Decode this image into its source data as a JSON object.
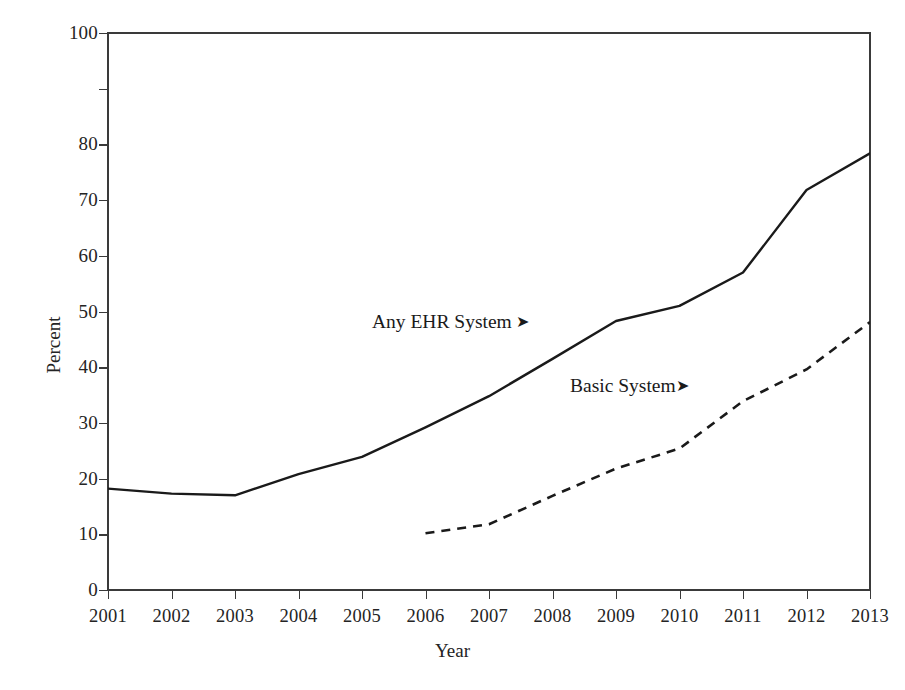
{
  "chart_data": {
    "type": "line",
    "title": "",
    "xlabel": "Year",
    "ylabel": "Percent",
    "x": [
      2001,
      2002,
      2003,
      2004,
      2005,
      2006,
      2007,
      2008,
      2009,
      2010,
      2011,
      2012,
      2013
    ],
    "xlim": [
      2001,
      2013
    ],
    "ylim": [
      0,
      100
    ],
    "xticks": [
      "2001",
      "2002",
      "2003",
      "2004",
      "2005",
      "2006",
      "2007",
      "2008",
      "2009",
      "2010",
      "2011",
      "2012",
      "2013"
    ],
    "yticks": [
      "0",
      "10",
      "20",
      "30",
      "40",
      "50",
      "60",
      "70",
      "80",
      "",
      "100"
    ],
    "ytick_values": [
      0,
      10,
      20,
      30,
      40,
      50,
      60,
      70,
      80,
      90,
      100
    ],
    "grid": false,
    "legend_position": "inline-annotation",
    "series": [
      {
        "name": "Any EHR System",
        "style": "solid",
        "color": "#1a1a1a",
        "x": [
          2001,
          2002,
          2003,
          2004,
          2005,
          2006,
          2007,
          2008,
          2009,
          2010,
          2011,
          2012,
          2013
        ],
        "values": [
          18.2,
          17.3,
          17.0,
          20.8,
          23.9,
          29.2,
          34.8,
          41.5,
          48.3,
          51.0,
          57.0,
          71.8,
          78.4
        ]
      },
      {
        "name": "Basic System",
        "style": "dashed",
        "color": "#1a1a1a",
        "x": [
          2006,
          2007,
          2008,
          2009,
          2010,
          2011,
          2012,
          2013
        ],
        "values": [
          10.2,
          11.8,
          16.9,
          21.8,
          25.4,
          33.9,
          39.6,
          48.1
        ]
      }
    ],
    "annotations": [
      {
        "id": "any-ehr",
        "text": "Any EHR System",
        "marker": "➤"
      },
      {
        "id": "basic",
        "text": "Basic System",
        "marker": "➤"
      }
    ]
  },
  "axes": {
    "y_title": "Percent",
    "x_title": "Year"
  },
  "colors": {
    "axis": "#3a3a3a",
    "line": "#1a1a1a",
    "text": "#242424",
    "background": "#ffffff"
  }
}
